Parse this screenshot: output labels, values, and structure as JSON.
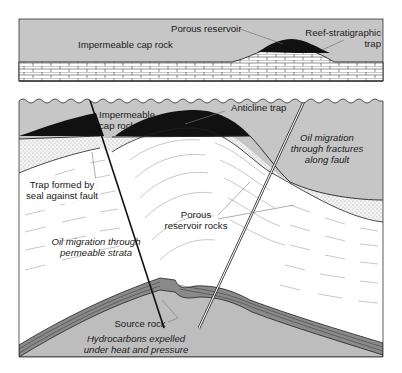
{
  "diagram": {
    "colors": {
      "cap_rock_gray": "#c6c6c6",
      "oil_black": "#111111",
      "reservoir_white": "#ffffff",
      "stipple_sand": "#ececec",
      "source_rock_gray": "#bdbdbd",
      "line": "#222222"
    },
    "top_panel": {
      "labels": {
        "cap_rock": "Impermeable cap rock",
        "porous_reservoir": "Porous reservoir",
        "reef_trap_line1": "Reef-stratigraphic",
        "reef_trap_line2": "trap"
      }
    },
    "bottom_panel": {
      "labels": {
        "cap_rock_line1": "Impermeable",
        "cap_rock_line2": "cap rock",
        "anticline_trap": "Anticline trap",
        "fault_migration_line1": "Oil migration",
        "fault_migration_line2": "through fractures",
        "fault_migration_line3": "along fault",
        "fault_trap_line1": "Trap formed by",
        "fault_trap_line2": "seal against fault",
        "porous_rocks_line1": "Porous",
        "porous_rocks_line2": "reservoir rocks",
        "strata_migration_line1": "Oil migration through",
        "strata_migration_line2": "permeable strata",
        "source_rock": "Source rock",
        "expelled_line1": "Hydrocarbons expelled",
        "expelled_line2": "under heat and pressure"
      }
    }
  }
}
